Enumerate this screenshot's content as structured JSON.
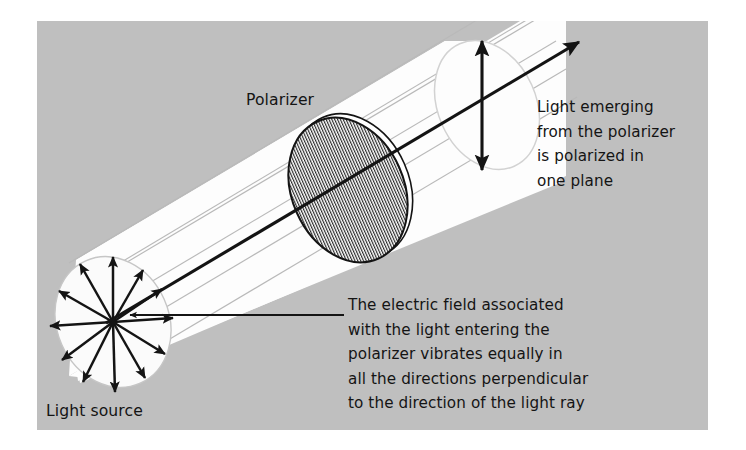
{
  "figure": {
    "title_semantic": "polarization-of-light-diagram",
    "background_color": "#ffffff",
    "panel_color": "#bfbfbf",
    "beam_color": "#fdfdfd",
    "ink_color": "#141414",
    "ray_line_color": "#b4b4b4",
    "panel": {
      "x": 37,
      "y": 21,
      "width": 671,
      "height": 409
    }
  },
  "labels": {
    "polarizer": "Polarizer",
    "light_source": "Light source"
  },
  "callout_emerging": {
    "name": "emerging-light-callout",
    "lines": [
      "Light emerging",
      "from the polarizer",
      "is polarized in",
      "one plane"
    ],
    "x": 537,
    "y": 112,
    "line_height": 24.5
  },
  "callout_electric_field": {
    "name": "electric-field-callout",
    "lines": [
      "The electric field associated",
      "with the light entering the",
      "polarizer vibrates equally in",
      "all the directions perpendicular",
      "to the direction of the light ray"
    ],
    "x": 348,
    "y": 310,
    "line_height": 24.5
  },
  "source_disc": {
    "name": "light-source-disc",
    "cx": 113,
    "cy": 322,
    "rx": 56,
    "ry": 67,
    "rotation": -24,
    "fill": "#fbfbfb",
    "stroke": "#c6c6c6",
    "arrow_count": 12,
    "arrow_angles_deg": [
      90,
      62,
      34,
      5,
      334,
      303,
      272,
      242,
      212,
      182,
      152,
      120
    ],
    "arrow_description": "electric field vectors radiating in all directions perpendicular to the ray"
  },
  "polarizer_disc": {
    "name": "polarizer-disc",
    "cx": 348,
    "cy": 190,
    "rx": 56,
    "ry": 75,
    "rotation": -24,
    "fill": "#ffffff",
    "stroke": "#141414",
    "hatch_orientation": "vertical",
    "hatch_spacing_px": 2.6
  },
  "exit_disc": {
    "name": "emerging-beam-disc",
    "cx": 487,
    "cy": 105,
    "rx": 49,
    "ry": 67,
    "rotation": -24,
    "fill": "#fdfdfd",
    "stroke": "#d2d2d2"
  },
  "polarization_arrow": {
    "name": "polarization-double-arrow",
    "x": 482,
    "y_top": 38,
    "y_bottom": 173,
    "double_headed": true
  },
  "ray_axis_arrow": {
    "name": "light-ray-axis-arrow",
    "x1": 106,
    "y1": 323,
    "x2": 579,
    "y2": 42,
    "double_headed": false
  },
  "leader_line": {
    "name": "electric-field-leader-line",
    "x1": 342,
    "y1": 315,
    "x2": 128,
    "y2": 315,
    "arrow_at_left": true
  },
  "beam": {
    "name": "light-beam-cylinder",
    "ray_lines_count": 5,
    "description": "white cylindrical beam travelling up-right from source through polarizer"
  }
}
